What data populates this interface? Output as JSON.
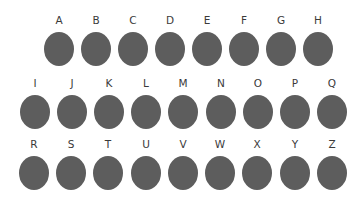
{
  "colors": {
    "background": "#ffffff",
    "circle": "#5d5d5d",
    "label": "#3a3a3a"
  },
  "rows": [
    {
      "keys": [
        {
          "label": "A"
        },
        {
          "label": "B"
        },
        {
          "label": "C"
        },
        {
          "label": "D"
        },
        {
          "label": "E"
        },
        {
          "label": "F"
        },
        {
          "label": "G"
        },
        {
          "label": "H"
        }
      ]
    },
    {
      "keys": [
        {
          "label": "I"
        },
        {
          "label": "J"
        },
        {
          "label": "K"
        },
        {
          "label": "L"
        },
        {
          "label": "M"
        },
        {
          "label": "N"
        },
        {
          "label": "O"
        },
        {
          "label": "P"
        },
        {
          "label": "Q"
        }
      ]
    },
    {
      "keys": [
        {
          "label": "R"
        },
        {
          "label": "S"
        },
        {
          "label": "T"
        },
        {
          "label": "U"
        },
        {
          "label": "V"
        },
        {
          "label": "W"
        },
        {
          "label": "X"
        },
        {
          "label": "Y"
        },
        {
          "label": "Z"
        }
      ]
    }
  ]
}
